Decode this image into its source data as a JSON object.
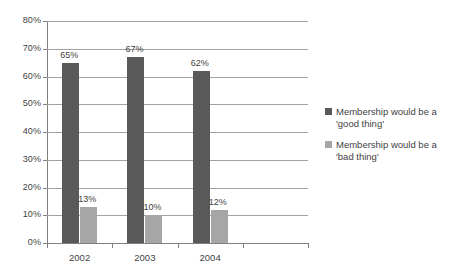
{
  "chart_data": {
    "type": "bar",
    "title": "",
    "subtitle": "",
    "xlabel": "",
    "ylabel": "",
    "categories": [
      "2002",
      "2003",
      "2004",
      ""
    ],
    "series": [
      {
        "name": "Membership would be a 'good thing'",
        "color": "#595959",
        "values": [
          65,
          67,
          62,
          null
        ],
        "labels": [
          "65%",
          "67%",
          "62%",
          ""
        ]
      },
      {
        "name": "Membership would be a 'bad thing'",
        "color": "#a6a6a6",
        "values": [
          13,
          10,
          12,
          null
        ],
        "labels": [
          "13%",
          "10%",
          "12%",
          ""
        ]
      }
    ],
    "ylim": [
      0,
      80
    ],
    "ytick_values": [
      0,
      10,
      20,
      30,
      40,
      50,
      60,
      70,
      80
    ],
    "ytick_labels": [
      "0%",
      "10%",
      "20%",
      "30%",
      "40%",
      "50%",
      "60%",
      "70%",
      "80%"
    ],
    "grid": true,
    "grid_axis": "y",
    "legend_position": "right",
    "annotations": []
  },
  "legend": {
    "entries": [
      {
        "label": "Membership would be a 'good thing'",
        "color": "#595959"
      },
      {
        "label": "Membership would be a 'bad thing'",
        "color": "#a6a6a6"
      }
    ]
  },
  "colors": {
    "background": "#ffffff",
    "axis": "#808080",
    "gridline": "#a3a3a3",
    "text": "#3f3f3f",
    "series_good": "#595959",
    "series_bad": "#a6a6a6"
  }
}
